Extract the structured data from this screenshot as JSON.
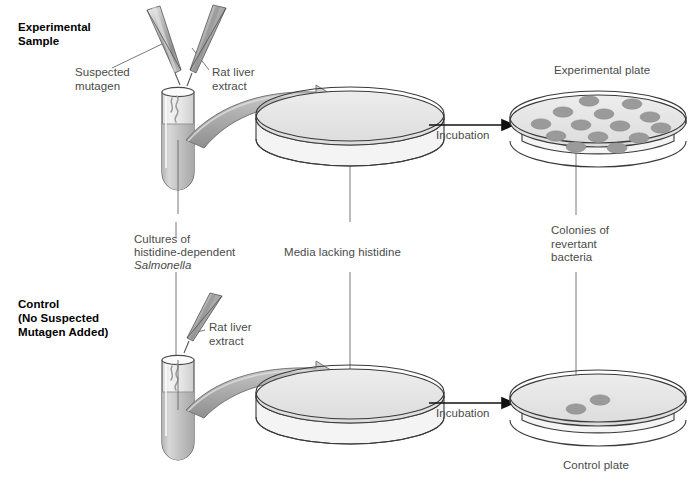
{
  "figure": {
    "title_experimental": "Experimental\nSample",
    "title_control": "Control\n(No Suspected\nMutagen Added)"
  },
  "labels": {
    "suspected_mutagen": "Suspected\nmutagen",
    "rat_liver_extract_top": "Rat liver\nextract",
    "rat_liver_extract_bottom": "Rat liver\nextract",
    "cultures_line1": "Cultures of",
    "cultures_line2": "histidine-dependent",
    "cultures_line3": "Salmonella",
    "media_lacking_histidine": "Media lacking histidine",
    "incubation_top": "Incubation",
    "incubation_bottom": "Incubation",
    "experimental_plate": "Experimental plate",
    "colonies_revertant": "Colonies of\nrevertant\nbacteria",
    "control_plate": "Control plate"
  },
  "colors": {
    "outline": "#333333",
    "text_gray": "#4a4a4a",
    "text_black": "#000000",
    "agar_fill": "#e9e9e9",
    "colony_fill": "#9a9a9a",
    "tube_media_fill": "#c9c9c9",
    "arrow_fill": "#b6b6b6",
    "dropper_fill": "#a8a8a8",
    "leader_line": "#5a5a5a"
  },
  "plates": {
    "experimental": {
      "name": "experimental-plate",
      "colony_count": 14,
      "colonies": [
        {
          "cx": 589,
          "cy": 101,
          "rx": 10,
          "ry": 5.2
        },
        {
          "cx": 632,
          "cy": 104,
          "rx": 10,
          "ry": 5.2
        },
        {
          "cx": 563,
          "cy": 112,
          "rx": 10,
          "ry": 5.2
        },
        {
          "cx": 604,
          "cy": 114,
          "rx": 10,
          "ry": 5.2
        },
        {
          "cx": 650,
          "cy": 117,
          "rx": 10,
          "ry": 5.2
        },
        {
          "cx": 541,
          "cy": 124,
          "rx": 10,
          "ry": 5.2
        },
        {
          "cx": 581,
          "cy": 125,
          "rx": 10,
          "ry": 5.2
        },
        {
          "cx": 620,
          "cy": 126,
          "rx": 10,
          "ry": 5.2
        },
        {
          "cx": 661,
          "cy": 128,
          "rx": 10,
          "ry": 5.2
        },
        {
          "cx": 556,
          "cy": 136,
          "rx": 10,
          "ry": 5.2
        },
        {
          "cx": 598,
          "cy": 137,
          "rx": 10,
          "ry": 5.2
        },
        {
          "cx": 639,
          "cy": 138,
          "rx": 10,
          "ry": 5.2
        },
        {
          "cx": 576,
          "cy": 147,
          "rx": 10,
          "ry": 5.2
        },
        {
          "cx": 617,
          "cy": 148,
          "rx": 10,
          "ry": 5.2
        }
      ]
    },
    "control": {
      "name": "control-plate",
      "colony_count": 2,
      "colonies": [
        {
          "cx": 576,
          "cy": 409,
          "rx": 10,
          "ry": 5.2
        },
        {
          "cx": 600,
          "cy": 400,
          "rx": 10,
          "ry": 5.2
        }
      ]
    },
    "media_top": {
      "name": "media-plate-top"
    },
    "media_bottom": {
      "name": "media-plate-bottom"
    }
  }
}
